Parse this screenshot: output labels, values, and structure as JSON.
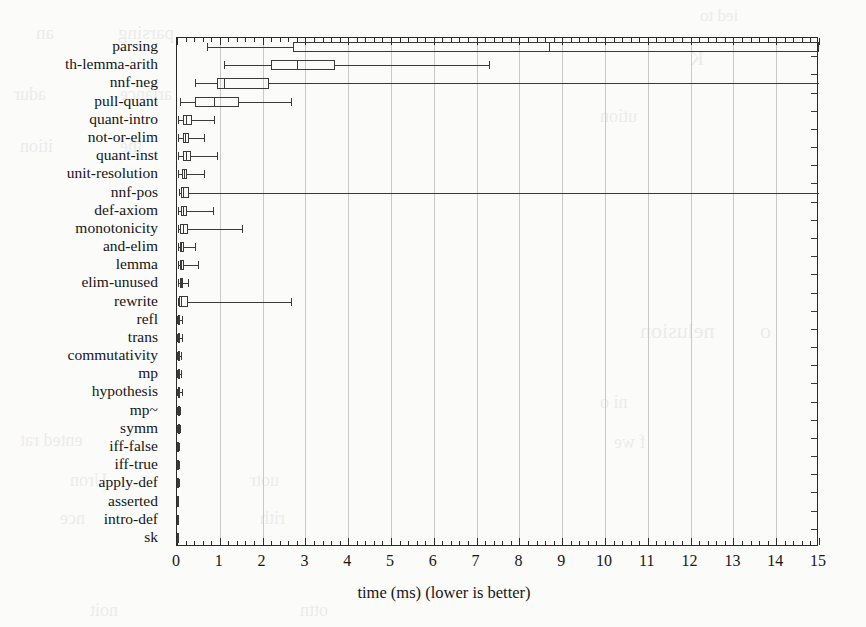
{
  "figure": {
    "title": "",
    "background_color": "#fbfbfa",
    "line_color": "#3a3a3a",
    "grid_color": "#c9c9c9"
  },
  "axis": {
    "x_title": "time (ms) (lower is better)",
    "x_ticks": [
      "0",
      "1",
      "2",
      "3",
      "4",
      "5",
      "6",
      "7",
      "8",
      "9",
      "10",
      "11",
      "12",
      "13",
      "14",
      "15"
    ],
    "y_title": ""
  },
  "ghost_text": [
    {
      "t": "ied to",
      "x": 700,
      "y": 6,
      "s": 17
    },
    {
      "t": "parsing",
      "x": 118,
      "y": 22,
      "s": 19
    },
    {
      "t": "an",
      "x": 36,
      "y": 22,
      "s": 19
    },
    {
      "t": "K",
      "x": 690,
      "y": 48,
      "s": 19
    },
    {
      "t": "adur",
      "x": 14,
      "y": 84,
      "s": 18
    },
    {
      "t": "ariance",
      "x": 120,
      "y": 84,
      "s": 18
    },
    {
      "t": "ution",
      "x": 600,
      "y": 106,
      "s": 18
    },
    {
      "t": "ition",
      "x": 20,
      "y": 136,
      "s": 18
    },
    {
      "t": "the",
      "x": 120,
      "y": 136,
      "s": 18
    },
    {
      "t": "nelusion",
      "x": 640,
      "y": 318,
      "s": 22
    },
    {
      "t": "o",
      "x": 760,
      "y": 318,
      "s": 22
    },
    {
      "t": "ented rat",
      "x": 20,
      "y": 430,
      "s": 18
    },
    {
      "t": "ni o",
      "x": 600,
      "y": 392,
      "s": 18
    },
    {
      "t": "f we",
      "x": 614,
      "y": 432,
      "s": 18
    },
    {
      "t": "Uron",
      "x": 70,
      "y": 470,
      "s": 18
    },
    {
      "t": "uotr",
      "x": 250,
      "y": 470,
      "s": 18
    },
    {
      "t": "nce",
      "x": 60,
      "y": 508,
      "s": 18
    },
    {
      "t": "rith",
      "x": 260,
      "y": 508,
      "s": 18
    },
    {
      "t": "noit",
      "x": 90,
      "y": 600,
      "s": 18
    },
    {
      "t": "ottn",
      "x": 300,
      "y": 600,
      "s": 18
    }
  ],
  "chart_data": {
    "type": "boxplot",
    "title": "",
    "xlabel": "time (ms) (lower is better)",
    "ylabel": "",
    "xlim": [
      0,
      15
    ],
    "orientation": "horizontal",
    "grid": true,
    "units": "ms",
    "categories": [
      "parsing",
      "th-lemma-arith",
      "nnf-neg",
      "pull-quant",
      "quant-intro",
      "not-or-elim",
      "quant-inst",
      "unit-resolution",
      "nnf-pos",
      "def-axiom",
      "monotonicity",
      "and-elim",
      "lemma",
      "elim-unused",
      "rewrite",
      "refl",
      "trans",
      "commutativity",
      "mp",
      "hypothesis",
      "mp~",
      "symm",
      "iff-false",
      "iff-true",
      "apply-def",
      "asserted",
      "intro-def",
      "sk"
    ],
    "boxes": [
      {
        "label": "parsing",
        "whisker_low": 0.7,
        "q1": 2.7,
        "median": 8.7,
        "q3": 15.0,
        "whisker_high": 15.0,
        "clipped_high": true
      },
      {
        "label": "th-lemma-arith",
        "whisker_low": 1.1,
        "q1": 2.2,
        "median": 2.8,
        "q3": 3.7,
        "whisker_high": 7.3,
        "clipped_high": false
      },
      {
        "label": "nnf-neg",
        "whisker_low": 0.42,
        "q1": 0.93,
        "median": 1.1,
        "q3": 2.15,
        "whisker_high": 15.0,
        "clipped_high": true
      },
      {
        "label": "pull-quant",
        "whisker_low": 0.07,
        "q1": 0.42,
        "median": 0.86,
        "q3": 1.45,
        "whisker_high": 2.66,
        "clipped_high": false
      },
      {
        "label": "quant-intro",
        "whisker_low": 0.03,
        "q1": 0.15,
        "median": 0.2,
        "q3": 0.34,
        "whisker_high": 0.86,
        "clipped_high": false
      },
      {
        "label": "not-or-elim",
        "whisker_low": 0.03,
        "q1": 0.13,
        "median": 0.19,
        "q3": 0.27,
        "whisker_high": 0.62,
        "clipped_high": false
      },
      {
        "label": "quant-inst",
        "whisker_low": 0.03,
        "q1": 0.13,
        "median": 0.2,
        "q3": 0.33,
        "whisker_high": 0.93,
        "clipped_high": false
      },
      {
        "label": "unit-resolution",
        "whisker_low": 0.03,
        "q1": 0.12,
        "median": 0.17,
        "q3": 0.24,
        "whisker_high": 0.64,
        "clipped_high": false
      },
      {
        "label": "nnf-pos",
        "whisker_low": 0.05,
        "q1": 0.1,
        "median": 0.15,
        "q3": 0.29,
        "whisker_high": 15.0,
        "clipped_high": true
      },
      {
        "label": "def-axiom",
        "whisker_low": 0.02,
        "q1": 0.09,
        "median": 0.13,
        "q3": 0.24,
        "whisker_high": 0.83,
        "clipped_high": false
      },
      {
        "label": "monotonicity",
        "whisker_low": 0.02,
        "q1": 0.08,
        "median": 0.13,
        "q3": 0.26,
        "whisker_high": 1.52,
        "clipped_high": false
      },
      {
        "label": "and-elim",
        "whisker_low": 0.02,
        "q1": 0.07,
        "median": 0.1,
        "q3": 0.16,
        "whisker_high": 0.41,
        "clipped_high": false
      },
      {
        "label": "lemma",
        "whisker_low": 0.02,
        "q1": 0.07,
        "median": 0.1,
        "q3": 0.17,
        "whisker_high": 0.5,
        "clipped_high": false
      },
      {
        "label": "elim-unused",
        "whisker_low": 0.02,
        "q1": 0.06,
        "median": 0.09,
        "q3": 0.14,
        "whisker_high": 0.26,
        "clipped_high": false
      },
      {
        "label": "rewrite",
        "whisker_low": 0.02,
        "q1": 0.05,
        "median": 0.1,
        "q3": 0.25,
        "whisker_high": 2.66,
        "clipped_high": false
      },
      {
        "label": "refl",
        "whisker_low": 0.01,
        "q1": 0.03,
        "median": 0.05,
        "q3": 0.07,
        "whisker_high": 0.12,
        "clipped_high": false
      },
      {
        "label": "trans",
        "whisker_low": 0.01,
        "q1": 0.03,
        "median": 0.05,
        "q3": 0.07,
        "whisker_high": 0.12,
        "clipped_high": false
      },
      {
        "label": "commutativity",
        "whisker_low": 0.01,
        "q1": 0.02,
        "median": 0.03,
        "q3": 0.05,
        "whisker_high": 0.09,
        "clipped_high": false
      },
      {
        "label": "mp",
        "whisker_low": 0.01,
        "q1": 0.02,
        "median": 0.03,
        "q3": 0.05,
        "whisker_high": 0.09,
        "clipped_high": false
      },
      {
        "label": "hypothesis",
        "whisker_low": 0.01,
        "q1": 0.03,
        "median": 0.04,
        "q3": 0.06,
        "whisker_high": 0.11,
        "clipped_high": false
      },
      {
        "label": "mp~",
        "whisker_low": 0.01,
        "q1": 0.02,
        "median": 0.02,
        "q3": 0.03,
        "whisker_high": 0.06,
        "clipped_high": false
      },
      {
        "label": "symm",
        "whisker_low": 0.01,
        "q1": 0.02,
        "median": 0.02,
        "q3": 0.03,
        "whisker_high": 0.06,
        "clipped_high": false
      },
      {
        "label": "iff-false",
        "whisker_low": 0.0,
        "q1": 0.01,
        "median": 0.01,
        "q3": 0.02,
        "whisker_high": 0.04,
        "clipped_high": false
      },
      {
        "label": "iff-true",
        "whisker_low": 0.0,
        "q1": 0.01,
        "median": 0.01,
        "q3": 0.02,
        "whisker_high": 0.04,
        "clipped_high": false
      },
      {
        "label": "apply-def",
        "whisker_low": 0.0,
        "q1": 0.01,
        "median": 0.01,
        "q3": 0.02,
        "whisker_high": 0.04,
        "clipped_high": false
      },
      {
        "label": "asserted",
        "whisker_low": 0.0,
        "q1": 0.0,
        "median": 0.01,
        "q3": 0.01,
        "whisker_high": 0.02,
        "clipped_high": false
      },
      {
        "label": "intro-def",
        "whisker_low": 0.0,
        "q1": 0.0,
        "median": 0.0,
        "q3": 0.01,
        "whisker_high": 0.02,
        "clipped_high": false
      },
      {
        "label": "sk",
        "whisker_low": 0.0,
        "q1": 0.0,
        "median": 0.0,
        "q3": 0.01,
        "whisker_high": 0.02,
        "clipped_high": false
      }
    ]
  }
}
